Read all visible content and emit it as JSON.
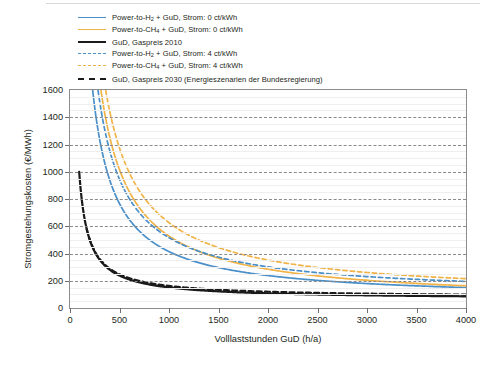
{
  "chart_data": {
    "type": "line",
    "title": "",
    "xlabel": "Volllaststunden GuD (h/a)",
    "ylabel": "Stromgestehungskosten (€/MWh)",
    "xlim": [
      0,
      4000
    ],
    "ylim": [
      0,
      1600
    ],
    "x_ticks": [
      0,
      500,
      1000,
      1500,
      2000,
      2500,
      3000,
      3500,
      4000
    ],
    "y_ticks": [
      0,
      200,
      400,
      600,
      800,
      1000,
      1200,
      1400,
      1600
    ],
    "grid": {
      "major_y_step": 200,
      "minor_y_step": 50,
      "major_style": "dashed",
      "minor_style": "solid",
      "x_grid": false
    },
    "legend_position": "above-plot-left",
    "colors": {
      "blue": "#4a8fc8",
      "orange": "#f0b347",
      "black": "#1a1a1a"
    },
    "series": [
      {
        "name": "Power-to-H2 + GuD, Strom: 0 ct/kWh",
        "color": "#4a8fc8",
        "style": "solid",
        "model": {
          "form": "a/x + b",
          "a": 352000,
          "b": 62
        },
        "x": [
          220,
          300,
          400,
          500,
          600,
          700,
          800,
          900,
          1000,
          1200,
          1400,
          1600,
          1800,
          2000,
          2250,
          2500,
          2750,
          3000,
          3250,
          3500,
          3750,
          4000
        ],
        "y": [
          1662,
          1235,
          942,
          766,
          649,
          565,
          502,
          453,
          414,
          355,
          313,
          282,
          258,
          238,
          219,
          203,
          190,
          179,
          170,
          163,
          156,
          150
        ]
      },
      {
        "name": "Power-to-CH4 + GuD, Strom: 0 ct/kWh",
        "color": "#f0b347",
        "style": "solid",
        "model": {
          "form": "a/x + b",
          "a": 487000,
          "b": 41
        },
        "x": [
          300,
          400,
          500,
          600,
          700,
          800,
          900,
          1000,
          1200,
          1400,
          1600,
          1800,
          2000,
          2250,
          2500,
          2750,
          3000,
          3250,
          3500,
          3750,
          4000
        ],
        "y": [
          1664,
          1259,
          1015,
          853,
          737,
          650,
          582,
          528,
          447,
          389,
          345,
          312,
          285,
          257,
          236,
          218,
          203,
          191,
          180,
          171,
          163
        ]
      },
      {
        "name": "GuD, Gaspreis 2010",
        "color": "#1a1a1a",
        "style": "solid",
        "model": {
          "form": "a/x + b",
          "a": 87000,
          "b": 64
        },
        "x": [
          93,
          150,
          200,
          250,
          300,
          400,
          500,
          600,
          800,
          1000,
          1250,
          1500,
          1750,
          2000,
          2500,
          3000,
          3500,
          4000
        ],
        "y": [
          999,
          644,
          499,
          412,
          354,
          282,
          238,
          209,
          173,
          151,
          134,
          122,
          114,
          108,
          99,
          93,
          89,
          86
        ]
      },
      {
        "name": "Power-to-H2 + GuD, Strom: 4 ct/kWh",
        "color": "#4a8fc8",
        "style": "dashed",
        "model": {
          "form": "a/x + b",
          "a": 428000,
          "b": 88
        },
        "x": [
          285,
          350,
          450,
          550,
          650,
          750,
          900,
          1050,
          1200,
          1400,
          1600,
          1800,
          2000,
          2250,
          2500,
          2750,
          3000,
          3250,
          3500,
          3750,
          4000
        ],
        "y": [
          1590,
          1311,
          1039,
          866,
          746,
          659,
          564,
          496,
          445,
          394,
          356,
          326,
          302,
          278,
          259,
          244,
          231,
          220,
          210,
          202,
          195
        ]
      },
      {
        "name": "Power-to-CH4 + GuD, Strom: 4 ct/kWh",
        "color": "#f0b347",
        "style": "dashed",
        "model": {
          "form": "a/x + b",
          "a": 548000,
          "b": 78
        },
        "x": [
          345,
          420,
          520,
          620,
          750,
          900,
          1050,
          1200,
          1400,
          1600,
          1800,
          2000,
          2250,
          2500,
          2750,
          3000,
          3250,
          3500,
          3750,
          4000
        ],
        "y": [
          1667,
          1383,
          1132,
          962,
          809,
          687,
          600,
          535,
          470,
          421,
          383,
          352,
          322,
          297,
          277,
          261,
          247,
          235,
          224,
          215
        ]
      },
      {
        "name": "GuD, Gaspreis 2030 (Energieszenarien der Bundesregierung)",
        "color": "#1a1a1a",
        "style": "dashed",
        "model": {
          "form": "a/x + b",
          "a": 85000,
          "b": 77
        },
        "x": [
          170,
          220,
          280,
          350,
          450,
          550,
          700,
          850,
          1000,
          1250,
          1500,
          1750,
          2000,
          2500,
          3000,
          3500,
          4000
        ],
        "y": [
          577,
          463,
          381,
          320,
          266,
          232,
          198,
          177,
          162,
          145,
          134,
          126,
          120,
          111,
          105,
          101,
          98
        ]
      }
    ]
  },
  "axes": {
    "y_title": "Stromgestehungskosten (€/MWh)",
    "x_title": "Volllaststunden GuD (h/a)",
    "y_tick_labels": [
      "0",
      "200",
      "400",
      "600",
      "800",
      "1000",
      "1200",
      "1400",
      "1600"
    ],
    "x_tick_labels": [
      "0",
      "500",
      "1000",
      "1500",
      "2000",
      "2500",
      "3000",
      "3500",
      "4000"
    ]
  },
  "legend": {
    "items": [
      {
        "label_html": "Power-to-H<sub>2</sub> + GuD, Strom: 0 ct/kWh",
        "color": "#4a8fc8",
        "style": "solid"
      },
      {
        "label_html": "Power-to-CH<sub>4</sub> + GuD, Strom: 0 ct/kWh",
        "color": "#f0b347",
        "style": "solid"
      },
      {
        "label_html": "GuD, Gaspreis 2010",
        "color": "#1a1a1a",
        "style": "solid"
      },
      {
        "label_html": "Power-to-H<sub>2</sub> + GuD, Strom: 4 ct/kWh",
        "color": "#4a8fc8",
        "style": "dashed"
      },
      {
        "label_html": "Power-to-CH<sub>4</sub> + GuD, Strom: 4 ct/kWh",
        "color": "#f0b347",
        "style": "dashed"
      },
      {
        "label_html": "GuD, Gaspreis 2030 (Energieszenarien der Bundesregierung)",
        "color": "#1a1a1a",
        "style": "dashed"
      }
    ]
  }
}
